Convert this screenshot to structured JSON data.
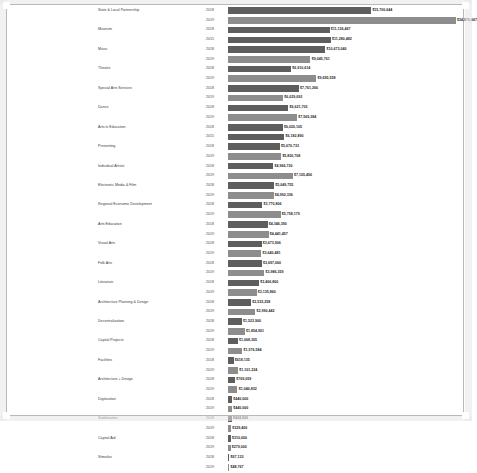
{
  "chart_data": {
    "type": "bar",
    "orientation": "horizontal",
    "title": "",
    "subtitle": "",
    "xlabel": "",
    "ylabel": "",
    "grid": false,
    "legend": "none",
    "xlim": [
      0,
      25000000
    ],
    "value_prefix": "$",
    "series": [
      {
        "name": "2018",
        "color": "#5e5e5e"
      },
      {
        "name": "2019",
        "color": "#8d8d8d"
      }
    ],
    "categories": [
      "State & Local Partnership",
      "Museum",
      "Music",
      "Theatre",
      "Special Arts Services",
      "Dance",
      "Arts in Education",
      "Presenting",
      "Individual Artists",
      "Electronic Media & Film",
      "Regional Economic Development",
      "Arts Education",
      "Visual Arts",
      "Folk Arts",
      "Literature",
      "Architecture Planning & Design",
      "Decentralization",
      "Capital Projects",
      "Facilities",
      "Architecture + Design",
      "Digitization",
      "Stabilization",
      "Capital Aid",
      "Stimulus"
    ],
    "rows": [
      {
        "category": "State & Local Partnership",
        "year": "2018",
        "value": 15700644,
        "label": "$15,700,644"
      },
      {
        "category": "State & Local Partnership",
        "year": "2019",
        "value": 24976667,
        "label": "$24,976,667"
      },
      {
        "category": "Museum",
        "year": "2018",
        "value": 11136467,
        "label": "$11,136,467"
      },
      {
        "category": "Museum",
        "year": "2015",
        "value": 11280482,
        "label": "$11,280,482"
      },
      {
        "category": "Music",
        "year": "2018",
        "value": 10673040,
        "label": "$10,673,040"
      },
      {
        "category": "Music",
        "year": "2019",
        "value": 9045761,
        "label": "$9,045,761"
      },
      {
        "category": "Theatre",
        "year": "2018",
        "value": 6910614,
        "label": "$6,910,614"
      },
      {
        "category": "Theatre",
        "year": "2019",
        "value": 9695558,
        "label": "$9,695,558"
      },
      {
        "category": "Special Arts Services",
        "year": "2018",
        "value": 7761266,
        "label": "$7,761,266"
      },
      {
        "category": "Special Arts Services",
        "year": "2019",
        "value": 6029093,
        "label": "$6,029,093"
      },
      {
        "category": "Dance",
        "year": "2018",
        "value": 6621705,
        "label": "$6,621,705"
      },
      {
        "category": "Dance",
        "year": "2019",
        "value": 7569384,
        "label": "$7,569,384"
      },
      {
        "category": "Arts in Education",
        "year": "2018",
        "value": 6020105,
        "label": "$6,020,105"
      },
      {
        "category": "Arts in Education",
        "year": "2015",
        "value": 6182890,
        "label": "$6,182,890"
      },
      {
        "category": "Presenting",
        "year": "2018",
        "value": 5670733,
        "label": "$5,670,733"
      },
      {
        "category": "Presenting",
        "year": "2019",
        "value": 5830708,
        "label": "$5,830,708"
      },
      {
        "category": "Individual Artists",
        "year": "2018",
        "value": 4966720,
        "label": "$4,966,720"
      },
      {
        "category": "Individual Artists",
        "year": "2019",
        "value": 7105456,
        "label": "$7,105,456"
      },
      {
        "category": "Electronic Media & Film",
        "year": "2018",
        "value": 5049755,
        "label": "$5,049,755"
      },
      {
        "category": "Electronic Media & Film",
        "year": "2019",
        "value": 4992336,
        "label": "$4,992,336"
      },
      {
        "category": "Regional Economic Development",
        "year": "2018",
        "value": 3770806,
        "label": "$3,770,806"
      },
      {
        "category": "Regional Economic Development",
        "year": "2019",
        "value": 5758179,
        "label": "$5,758,179"
      },
      {
        "category": "Arts Education",
        "year": "2018",
        "value": 4346390,
        "label": "$4,346,390"
      },
      {
        "category": "Arts Education",
        "year": "2019",
        "value": 4441457,
        "label": "$4,441,457"
      },
      {
        "category": "Visual Arts",
        "year": "2018",
        "value": 3673906,
        "label": "$3,673,906"
      },
      {
        "category": "Visual Arts",
        "year": "2019",
        "value": 3640481,
        "label": "$3,640,481"
      },
      {
        "category": "Folk Arts",
        "year": "2018",
        "value": 3697060,
        "label": "$3,697,060"
      },
      {
        "category": "Folk Arts",
        "year": "2019",
        "value": 3986359,
        "label": "$3,986,359"
      },
      {
        "category": "Literature",
        "year": "2018",
        "value": 3406800,
        "label": "$3,406,800"
      },
      {
        "category": "Literature",
        "year": "2019",
        "value": 3135860,
        "label": "$3,135,860"
      },
      {
        "category": "Architecture Planning & Design",
        "year": "2018",
        "value": 2532258,
        "label": "$2,532,258"
      },
      {
        "category": "Architecture Planning & Design",
        "year": "2019",
        "value": 2990442,
        "label": "$2,990,442"
      },
      {
        "category": "Decentralization",
        "year": "2018",
        "value": 1523900,
        "label": "$1,523,900"
      },
      {
        "category": "Decentralization",
        "year": "2019",
        "value": 1854901,
        "label": "$1,854,901"
      },
      {
        "category": "Capital Projects",
        "year": "2018",
        "value": 1068305,
        "label": "$1,068,305"
      },
      {
        "category": "Capital Projects",
        "year": "2019",
        "value": 1576584,
        "label": "$1,576,584"
      },
      {
        "category": "Facilities",
        "year": "2018",
        "value": 618135,
        "label": "$618,135"
      },
      {
        "category": "Facilities",
        "year": "2019",
        "value": 1101224,
        "label": "$1,101,224"
      },
      {
        "category": "Architecture + Design",
        "year": "2018",
        "value": 769059,
        "label": "$769,059"
      },
      {
        "category": "Architecture + Design",
        "year": "2019",
        "value": 1040832,
        "label": "$1,040,832"
      },
      {
        "category": "Digitization",
        "year": "2018",
        "value": 440000,
        "label": "$440,000"
      },
      {
        "category": "Digitization",
        "year": "2019",
        "value": 440000,
        "label": "$440,000"
      },
      {
        "category": "Stabilization",
        "year": "2018",
        "value": 424500,
        "label": "$424,500"
      },
      {
        "category": "Stabilization",
        "year": "2019",
        "value": 329400,
        "label": "$329,400"
      },
      {
        "category": "Capital Aid",
        "year": "2018",
        "value": 310000,
        "label": "$310,000"
      },
      {
        "category": "Capital Aid",
        "year": "2019",
        "value": 279000,
        "label": "$279,000"
      },
      {
        "category": "Stimulus",
        "year": "2018",
        "value": 67133,
        "label": "$67,133"
      },
      {
        "category": "Stimulus",
        "year": "2019",
        "value": 48767,
        "label": "$48,767"
      }
    ]
  }
}
